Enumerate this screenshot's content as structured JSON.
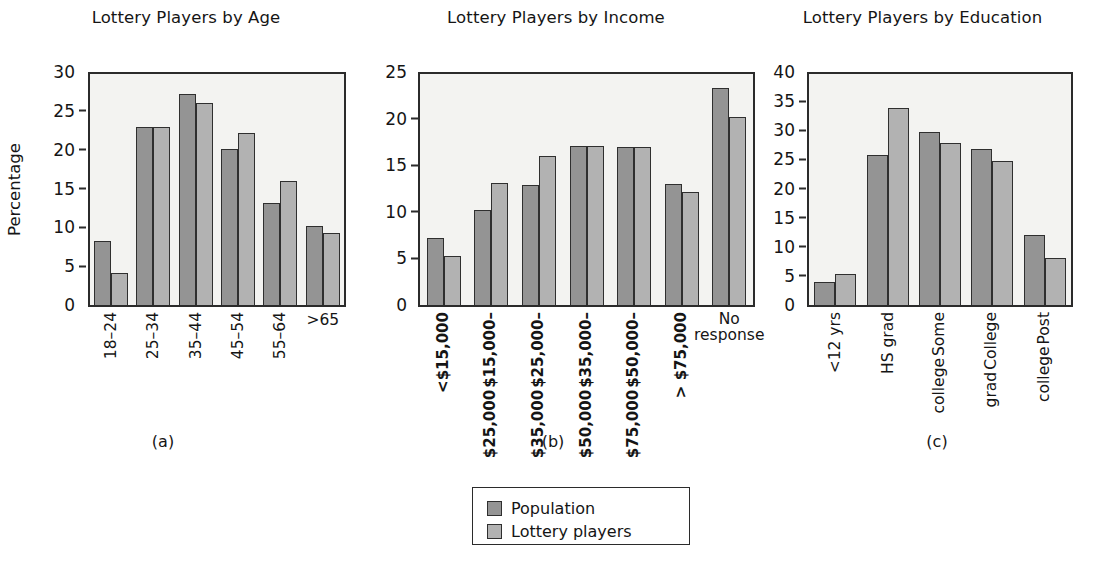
{
  "figure": {
    "series_names": [
      "Population",
      "Lottery players"
    ],
    "colors": {
      "population": "#949494",
      "lottery_players": "#b2b2b2",
      "outline": "#2f2f2f",
      "plot_background": "#f3f3f1"
    },
    "legend": {
      "position": "bottom-center",
      "items": [
        {
          "label": "Population",
          "color": "#949494"
        },
        {
          "label": "Lottery players",
          "color": "#b2b2b2"
        }
      ]
    },
    "subcaptions": [
      "(a)",
      "(b)",
      "(c)"
    ]
  },
  "chart_data": [
    {
      "type": "bar",
      "title": "Lottery Players by Age",
      "xlabel": "",
      "ylabel": "Percentage",
      "ylim": [
        0,
        30
      ],
      "yticks": [
        0,
        5,
        10,
        15,
        20,
        25,
        30
      ],
      "grid": false,
      "categories": [
        "18–24",
        "25–34",
        "35–44",
        "45–54",
        "55–64",
        ">65"
      ],
      "series": [
        {
          "name": "Population",
          "values": [
            8.3,
            23.1,
            27.4,
            20.3,
            13.2,
            10.3
          ]
        },
        {
          "name": "Lottery players",
          "values": [
            4.2,
            23.1,
            26.2,
            22.4,
            16.1,
            9.4
          ]
        }
      ]
    },
    {
      "type": "bar",
      "title": "Lottery Players by Income",
      "xlabel": "",
      "ylabel": "",
      "ylim": [
        0,
        25
      ],
      "yticks": [
        0,
        5,
        10,
        15,
        20,
        25
      ],
      "grid": false,
      "categories": [
        "<$15,000",
        "$15,000–$25,000",
        "$25,000–$35,000",
        "$35,000–$50,000",
        "$50,000–$75,000",
        ">$75,000",
        "No response"
      ],
      "series": [
        {
          "name": "Population",
          "values": [
            7.2,
            10.3,
            13.0,
            17.2,
            17.1,
            13.1,
            23.5
          ]
        },
        {
          "name": "Lottery players",
          "values": [
            5.3,
            13.2,
            16.1,
            17.2,
            17.1,
            12.2,
            20.4
          ]
        }
      ]
    },
    {
      "type": "bar",
      "title": "Lottery Players by Education",
      "xlabel": "",
      "ylabel": "",
      "ylim": [
        0,
        40
      ],
      "yticks": [
        0,
        5,
        10,
        15,
        20,
        25,
        30,
        35,
        40
      ],
      "grid": false,
      "categories": [
        "<12 yrs",
        "HS grad",
        "Some college",
        "College grad",
        "Post college"
      ],
      "series": [
        {
          "name": "Population",
          "values": [
            3.9,
            25.9,
            30.0,
            27.1,
            12.1
          ]
        },
        {
          "name": "Lottery players",
          "values": [
            5.4,
            34.1,
            28.0,
            25.0,
            8.2
          ]
        }
      ]
    }
  ],
  "panels": [
    {
      "id": "age",
      "title": "Lottery Players by Age",
      "ylabel": "Percentage",
      "yticks": [
        "0",
        "5",
        "10",
        "15",
        "20",
        "25",
        "30"
      ],
      "subcaption": "(a)",
      "xticks": [
        {
          "line1": "18–24",
          "line2": "",
          "rotated": true,
          "bold": false
        },
        {
          "line1": "25–34",
          "line2": "",
          "rotated": true,
          "bold": false
        },
        {
          "line1": "35–44",
          "line2": "",
          "rotated": true,
          "bold": false
        },
        {
          "line1": "45–54",
          "line2": "",
          "rotated": true,
          "bold": false
        },
        {
          "line1": "55–64",
          "line2": "",
          "rotated": true,
          "bold": false
        },
        {
          "line1": ">65",
          "line2": "",
          "rotated": false,
          "bold": false
        }
      ]
    },
    {
      "id": "income",
      "title": "Lottery Players by Income",
      "ylabel": "",
      "yticks": [
        "0",
        "5",
        "10",
        "15",
        "20",
        "25"
      ],
      "subcaption": "(b)",
      "xticks": [
        {
          "line1": "<$15,000",
          "line2": "",
          "rotated": true,
          "bold": true
        },
        {
          "line1": "$15,000–",
          "line2": "$25,000",
          "rotated": true,
          "bold": true
        },
        {
          "line1": "$25,000–",
          "line2": "$35,000",
          "rotated": true,
          "bold": true
        },
        {
          "line1": "$35,000–",
          "line2": "$50,000",
          "rotated": true,
          "bold": true
        },
        {
          "line1": "$50,000–",
          "line2": "$75,000",
          "rotated": true,
          "bold": true
        },
        {
          "line1": "> $75,000",
          "line2": "",
          "rotated": true,
          "bold": true
        },
        {
          "line1": "No",
          "line2": "response",
          "rotated": false,
          "bold": false
        }
      ]
    },
    {
      "id": "education",
      "title": "Lottery Players by Education",
      "ylabel": "",
      "yticks": [
        "0",
        "5",
        "10",
        "15",
        "20",
        "25",
        "30",
        "35",
        "40"
      ],
      "subcaption": "(c)",
      "xticks": [
        {
          "line1": "<12 yrs",
          "line2": "",
          "rotated": true,
          "bold": false
        },
        {
          "line1": "HS grad",
          "line2": "",
          "rotated": true,
          "bold": false
        },
        {
          "line1": "Some",
          "line2": "college",
          "rotated": true,
          "bold": false
        },
        {
          "line1": "College",
          "line2": "grad",
          "rotated": true,
          "bold": false
        },
        {
          "line1": "Post",
          "line2": "college",
          "rotated": true,
          "bold": false
        }
      ]
    }
  ]
}
